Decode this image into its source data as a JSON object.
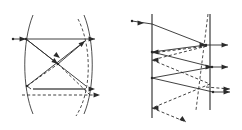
{
  "figure": {
    "background_color": "#ffffff",
    "line_color": "#2b2b2b",
    "thick_line_color": "#555555",
    "mirror_color": "#4a4a4a",
    "width": 242,
    "height": 130,
    "panels": [
      {
        "id": "left-panel",
        "name": "curved-mirror-ray-diagram",
        "description": "Two opposing curved mirror arcs with crossing solid and dashed rays",
        "elements": {
          "arcs": [
            {
              "name": "left-mirror-arc",
              "style": "solid",
              "d": "M 33 15 C 22 42 22 88 33 114"
            },
            {
              "name": "right-mirror-arc",
              "style": "solid",
              "d": "M 84 15 C 95 42 95 88 84 114"
            },
            {
              "name": "right-dashed-arc",
              "style": "dashed",
              "d": "M 78 19 C 92 46 92 92 76 116"
            }
          ],
          "solid_rays": [
            {
              "name": "incoming-top-ray",
              "x1": 13,
              "y1": 39,
              "x2": 95,
              "y2": 39
            },
            {
              "name": "ray-upper-left-to-center",
              "x1": 26,
              "y1": 39,
              "x2": 58,
              "y2": 64
            },
            {
              "name": "ray-center-to-upper-right",
              "x1": 58,
              "y1": 64,
              "x2": 85,
              "y2": 41
            },
            {
              "name": "ray-upper-left-long-diagonal",
              "x1": 26,
              "y1": 39,
              "x2": 86,
              "y2": 86
            },
            {
              "name": "ray-lower-left-to-upper-right",
              "x1": 27,
              "y1": 86,
              "x2": 85,
              "y2": 41
            },
            {
              "name": "ray-lower-left-short",
              "x1": 27,
              "y1": 86,
              "x2": 31,
              "y2": 89
            }
          ],
          "thick_rays": [
            {
              "name": "lower-horizontal-beam",
              "x1": 33,
              "y1": 89,
              "x2": 86,
              "y2": 89
            }
          ],
          "dashed_rays": [
            {
              "name": "dashed-center-to-lower-right",
              "x1": 58,
              "y1": 64,
              "x2": 90,
              "y2": 95
            },
            {
              "name": "dashed-lower-horizontal",
              "x1": 22,
              "y1": 95,
              "x2": 100,
              "y2": 95
            },
            {
              "name": "dashed-left-to-center",
              "x1": 27,
              "y1": 86,
              "x2": 58,
              "y2": 64
            }
          ],
          "arrow_markers": [
            {
              "name": "top-ray-entry-arrow",
              "x": 26,
              "y": 39,
              "dir": "right"
            },
            {
              "name": "top-ray-exit-arrow",
              "x": 95,
              "y": 39,
              "dir": "right"
            },
            {
              "name": "lower-solid-exit-arrow",
              "x": 95,
              "y": 89,
              "dir": "right"
            },
            {
              "name": "lower-dashed-exit-arrow",
              "x": 100,
              "y": 95,
              "dir": "right"
            },
            {
              "name": "center-cross-arrow",
              "x": 58,
              "y": 64,
              "dir": "down-right"
            },
            {
              "name": "upper-right-reflect-arrow",
              "x": 85,
              "y": 41,
              "dir": "up-right"
            },
            {
              "name": "diagonal-mid-arrow",
              "x": 60,
              "y": 58,
              "dir": "down-right"
            }
          ],
          "node_dots": [
            {
              "name": "entry-point-dot",
              "x": 13,
              "y": 39
            },
            {
              "name": "left-mirror-contact-dot",
              "x": 26,
              "y": 39
            },
            {
              "name": "lower-left-contact-dot",
              "x": 27,
              "y": 86
            },
            {
              "name": "center-crossing-dot",
              "x": 58,
              "y": 64
            }
          ]
        }
      },
      {
        "id": "right-panel",
        "name": "plane-mirror-ray-diagram",
        "description": "Two parallel vertical plane mirrors with zig-zag reflected solid and dashed rays",
        "elements": {
          "mirrors": [
            {
              "name": "left-plane-mirror",
              "x1": 152,
              "y1": 14,
              "x2": 152,
              "y2": 118
            },
            {
              "name": "right-plane-mirror",
              "x1": 210,
              "y1": 14,
              "x2": 210,
              "y2": 110
            }
          ],
          "dashed_arcs": [
            {
              "name": "tilted-dashed-line",
              "style": "dashed",
              "d": "M 208 14 L 196 110"
            }
          ],
          "solid_rays": [
            {
              "name": "incoming-ray",
              "x1": 132,
              "y1": 21,
              "x2": 152,
              "y2": 24
            },
            {
              "name": "ray-down-to-right-mirror-1",
              "x1": 152,
              "y1": 24,
              "x2": 206,
              "y2": 45
            },
            {
              "name": "ray-exit-top-right",
              "x1": 206,
              "y1": 45,
              "x2": 228,
              "y2": 45
            },
            {
              "name": "ray-back-to-left-mirror-1",
              "x1": 206,
              "y1": 45,
              "x2": 152,
              "y2": 52
            },
            {
              "name": "ray-down-to-right-mirror-2",
              "x1": 152,
              "y1": 52,
              "x2": 212,
              "y2": 67
            },
            {
              "name": "ray-exit-middle-right",
              "x1": 212,
              "y1": 67,
              "x2": 228,
              "y2": 67
            },
            {
              "name": "ray-back-to-left-mirror-2",
              "x1": 212,
              "y1": 67,
              "x2": 152,
              "y2": 78
            },
            {
              "name": "ray-down-to-right-mirror-3",
              "x1": 152,
              "y1": 78,
              "x2": 213,
              "y2": 92
            },
            {
              "name": "ray-exit-lower-right",
              "x1": 213,
              "y1": 92,
              "x2": 230,
              "y2": 92
            }
          ],
          "dashed_rays": [
            {
              "name": "dashed-ray-1",
              "x1": 152,
              "y1": 53,
              "x2": 207,
              "y2": 46
            },
            {
              "name": "dashed-ray-2",
              "x1": 207,
              "y1": 46,
              "x2": 152,
              "y2": 60
            },
            {
              "name": "dashed-ray-3",
              "x1": 152,
              "y1": 60,
              "x2": 210,
              "y2": 84
            },
            {
              "name": "dashed-ray-4",
              "x1": 210,
              "y1": 84,
              "x2": 152,
              "y2": 108
            },
            {
              "name": "dashed-ray-exit",
              "x1": 152,
              "y1": 108,
              "x2": 186,
              "y2": 122
            },
            {
              "name": "dashed-exit-upper-right",
              "x1": 206,
              "y1": 87,
              "x2": 230,
              "y2": 89
            }
          ],
          "arrow_markers": [
            {
              "name": "incoming-arrow",
              "x": 144,
              "y": 23,
              "dir": "right"
            },
            {
              "name": "exit-top-right-arrow",
              "x": 228,
              "y": 45,
              "dir": "right"
            },
            {
              "name": "exit-middle-right-arrow",
              "x": 228,
              "y": 67,
              "dir": "right"
            },
            {
              "name": "exit-lower-right-arrow",
              "x": 230,
              "y": 92,
              "dir": "right"
            },
            {
              "name": "dashed-exit-right-arrow",
              "x": 230,
              "y": 89,
              "dir": "right"
            },
            {
              "name": "dashed-exit-down-arrow",
              "x": 186,
              "y": 122,
              "dir": "down-right"
            },
            {
              "name": "left-mirror-hit-arrow-1",
              "x": 152,
              "y": 52,
              "dir": "left"
            },
            {
              "name": "left-mirror-hit-arrow-2",
              "x": 152,
              "y": 60,
              "dir": "left"
            },
            {
              "name": "left-mirror-hit-arrow-3",
              "x": 152,
              "y": 108,
              "dir": "left"
            },
            {
              "name": "right-mirror-hit-arrow-1",
              "x": 206,
              "y": 45,
              "dir": "right"
            },
            {
              "name": "right-mirror-hit-arrow-2",
              "x": 212,
              "y": 67,
              "dir": "right"
            }
          ],
          "node_dots": [
            {
              "name": "incoming-start-dot",
              "x": 132,
              "y": 21
            },
            {
              "name": "left-mirror-node-1",
              "x": 152,
              "y": 52
            },
            {
              "name": "left-mirror-node-2",
              "x": 152,
              "y": 78
            },
            {
              "name": "right-mirror-node-1",
              "x": 206,
              "y": 45
            },
            {
              "name": "right-mirror-node-2",
              "x": 212,
              "y": 67
            },
            {
              "name": "right-mirror-node-3",
              "x": 213,
              "y": 92
            }
          ]
        }
      }
    ]
  }
}
